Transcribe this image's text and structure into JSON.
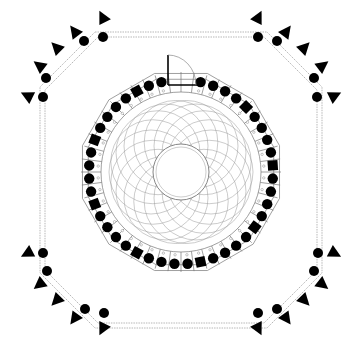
{
  "diagram": {
    "type": "architectural-floor-plan",
    "title": "",
    "background": "#ffffff",
    "line_color": "#888888",
    "fill_color": "#000000",
    "center": [
      181,
      172
    ],
    "room": {
      "shape": "dodecagon",
      "outer_radius": 102,
      "inner_radius": 84,
      "seat_ring_radius": 92,
      "seat_count": 44
    },
    "rosette": {
      "radius": 72,
      "circle_count": 18,
      "center_opening_radius": 28
    },
    "door": {
      "position": "top",
      "swing": "quarter-arc"
    },
    "corridor": {
      "shape": "chamfered-square",
      "inset": 40,
      "chamfer": 55
    },
    "speaker_groups": [
      {
        "corner": "top-left",
        "count": 5
      },
      {
        "corner": "top-right",
        "count": 5
      },
      {
        "corner": "bottom-left",
        "count": 5
      },
      {
        "corner": "bottom-right",
        "count": 5
      }
    ],
    "labels": []
  }
}
